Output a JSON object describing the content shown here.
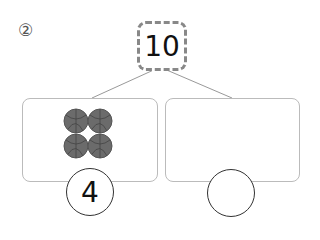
{
  "problem": {
    "number_label": "②",
    "whole": "10",
    "parts": [
      {
        "value": "4",
        "items": {
          "icon": "basketball-icon",
          "count": 4,
          "color": "#6b6b6b"
        }
      },
      {
        "value": "",
        "items": {
          "icon": "",
          "count": 0
        }
      }
    ]
  }
}
